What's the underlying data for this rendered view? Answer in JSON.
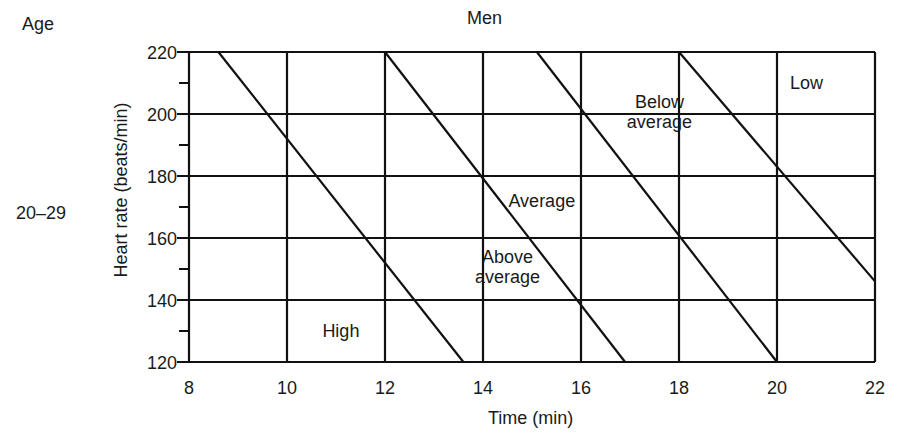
{
  "header": {
    "age_label": "Age",
    "title": "Men",
    "age_group": "20–29"
  },
  "axes": {
    "xlabel": "Time (min)",
    "ylabel": "Heart rate (beats/min)"
  },
  "colors": {
    "line": "#111111",
    "background": "#ffffff",
    "text": "#1a1a1a"
  },
  "chart_data": {
    "type": "line",
    "title": "Men",
    "subtitle": "Age 20–29",
    "xlabel": "Time (min)",
    "ylabel": "Heart rate (beats/min)",
    "xlim": [
      8,
      22
    ],
    "ylim": [
      120,
      220
    ],
    "x_ticks": [
      8,
      10,
      12,
      14,
      16,
      18,
      20,
      22
    ],
    "y_ticks": [
      120,
      140,
      160,
      180,
      200,
      220
    ],
    "y_minor_ticks": [
      130,
      150,
      170,
      190,
      210
    ],
    "grid": true,
    "legend": null,
    "series": [
      {
        "name": "High / Above average boundary",
        "points": [
          [
            8.6,
            220
          ],
          [
            13.6,
            120
          ]
        ]
      },
      {
        "name": "Above average / Average boundary",
        "points": [
          [
            12.0,
            220
          ],
          [
            16.9,
            120
          ]
        ]
      },
      {
        "name": "Average / Below average boundary",
        "points": [
          [
            15.1,
            220
          ],
          [
            20.0,
            120
          ]
        ]
      },
      {
        "name": "Below average / Low boundary",
        "points": [
          [
            18.0,
            220
          ],
          [
            22.0,
            146
          ]
        ]
      }
    ],
    "annotations": [
      {
        "text": "High",
        "x": 11.1,
        "y": 130
      },
      {
        "text": "Above average",
        "x": 14.5,
        "y": 149
      },
      {
        "text": "Average",
        "x": 15.2,
        "y": 172
      },
      {
        "text": "Below average",
        "x": 17.6,
        "y": 199
      },
      {
        "text": "Low",
        "x": 20.6,
        "y": 210
      }
    ]
  }
}
